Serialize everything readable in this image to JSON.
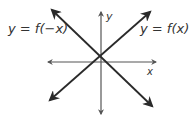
{
  "diagram": {
    "labels": {
      "left_function": "y = f(−x)",
      "right_function": "y = f(x)",
      "y_axis": "y",
      "x_axis": "x"
    },
    "colors": {
      "line": "#2a2a2a",
      "axis": "#555555",
      "text": "#333333",
      "background": "#ffffff"
    }
  }
}
